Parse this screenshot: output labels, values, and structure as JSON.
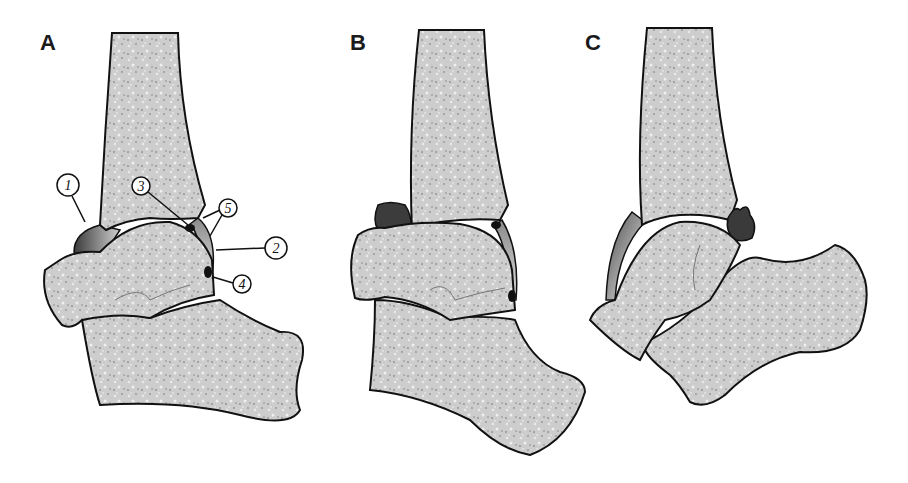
{
  "figure": {
    "panels": [
      {
        "id": "A",
        "label": "A",
        "description": "Normal ankle joint with numbered callouts",
        "callouts": [
          {
            "number": "1",
            "target": "anterior joint recess"
          },
          {
            "number": "2",
            "target": "posterior joint capsule"
          },
          {
            "number": "3",
            "target": "posterior tibial lip fat/soft tissue"
          },
          {
            "number": "4",
            "target": "posterior talar soft tissue"
          },
          {
            "number": "5",
            "target": "posterior recess margins"
          }
        ]
      },
      {
        "id": "B",
        "label": "B",
        "description": "Ankle with distended anterior recess (dark mass)"
      },
      {
        "id": "C",
        "label": "C",
        "description": "Ankle in plantarflexion with posterior soft-tissue impingement"
      }
    ]
  },
  "colors": {
    "bone_fill": "#c9c9c9",
    "bone_outline": "#111111",
    "capsule_dark": "#3a3a3a",
    "capsule_light": "#bdbdbd",
    "background": "#ffffff"
  }
}
